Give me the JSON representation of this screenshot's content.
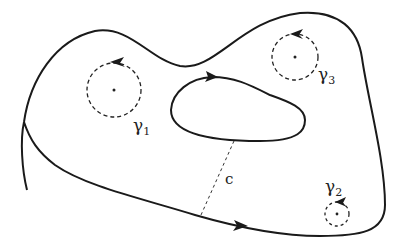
{
  "diagram": {
    "title": "",
    "colors": {
      "stroke": "#1a1a1a",
      "background": "#ffffff",
      "text": "#222222"
    },
    "outer_boundary": {
      "orientation": "counterclockwise",
      "style": "solid"
    },
    "inner_boundary": {
      "orientation": "clockwise",
      "style": "solid"
    },
    "cut": {
      "label": "c",
      "style": "dashed"
    },
    "small_circles": [
      {
        "id": "gamma1",
        "symbol": "γ",
        "subscript": "1",
        "style": "dashed"
      },
      {
        "id": "gamma2",
        "symbol": "γ",
        "subscript": "2",
        "style": "dashed"
      },
      {
        "id": "gamma3",
        "symbol": "γ",
        "subscript": "3",
        "style": "dashed"
      }
    ]
  }
}
